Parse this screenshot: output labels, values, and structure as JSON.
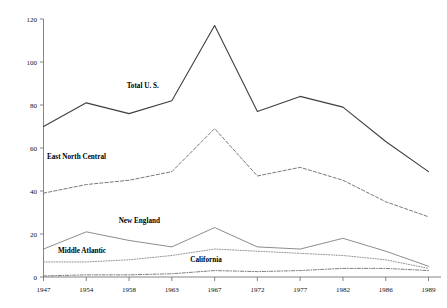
{
  "chart_data": {
    "type": "line",
    "title": "",
    "subtitle": "",
    "xlabel": "",
    "ylabel": "",
    "x": [
      1947,
      1954,
      1958,
      1963,
      1967,
      1972,
      1977,
      1982,
      1986,
      1989
    ],
    "xtick_labels": [
      "1947",
      "1954",
      "1958",
      "1963",
      "1967",
      "1972",
      "1977",
      "1982",
      "1986",
      "1989"
    ],
    "ytick_labels": [
      "0",
      "20",
      "40",
      "60",
      "80",
      "100",
      "120"
    ],
    "yticks": [
      0,
      20,
      40,
      60,
      80,
      100,
      120
    ],
    "ylim": [
      0,
      120
    ],
    "grid": false,
    "legend_position": "inline-labels",
    "series": [
      {
        "name": "Total U. S.",
        "label": "Total U. S.",
        "style": "solid",
        "color": "#3f3f3f",
        "width": 1.1,
        "values": [
          70,
          81,
          76,
          82,
          117,
          77,
          84,
          79,
          63,
          49
        ],
        "label_x": 1959.6,
        "label_y": 88
      },
      {
        "name": "East North Central",
        "label": "East North Central",
        "style": "dashed",
        "color": "#6a6a6a",
        "width": 0.9,
        "values": [
          39,
          43,
          45,
          49,
          69,
          47,
          51,
          45,
          35,
          28
        ],
        "label_x": 1952.4,
        "label_y": 55
      },
      {
        "name": "New England",
        "label": "New England",
        "style": "solid",
        "color": "#808080",
        "width": 0.9,
        "values": [
          13,
          21,
          17,
          14,
          23,
          14,
          13,
          18,
          12,
          5
        ],
        "label_x": 1959.2,
        "label_y": 25
      },
      {
        "name": "Middle Atlantic",
        "label": "Middle Atlantic",
        "style": "dotted",
        "color": "#8a8a8a",
        "width": 0.9,
        "values": [
          7,
          7,
          8,
          10,
          13,
          12,
          11,
          10,
          8,
          4
        ],
        "label_x": 1953.3,
        "label_y": 11
      },
      {
        "name": "California",
        "label": "California",
        "style": "dashdot",
        "color": "#6f6f6f",
        "width": 0.9,
        "values": [
          0.5,
          1,
          1,
          1.5,
          3,
          2.5,
          3,
          4,
          4,
          3
        ],
        "label_x": 1966.2,
        "label_y": 7
      }
    ]
  }
}
